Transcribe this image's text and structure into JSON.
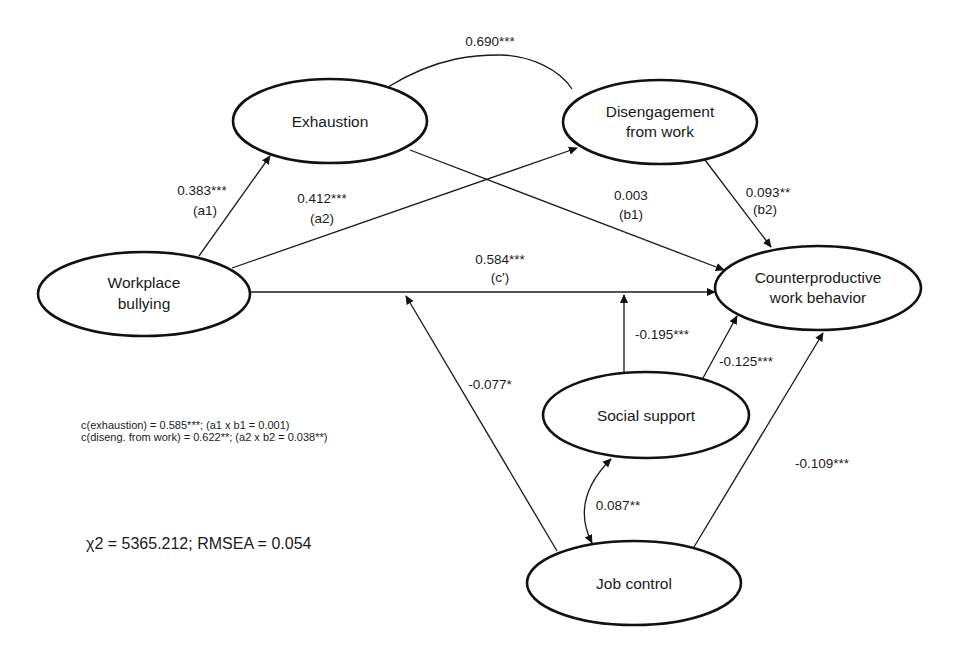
{
  "diagram": {
    "type": "structural-equation-path-model",
    "nodes": {
      "exhaustion": {
        "label_lines": [
          "Exhaustion"
        ]
      },
      "disengagement": {
        "label_lines": [
          "Disengagement",
          "from work"
        ]
      },
      "bullying": {
        "label_lines": [
          "Workplace",
          "bullying"
        ]
      },
      "cwb": {
        "label_lines": [
          "Counterproductive",
          "work behavior"
        ]
      },
      "social_support": {
        "label_lines": [
          "Social support"
        ]
      },
      "job_control": {
        "label_lines": [
          "Job control"
        ]
      }
    },
    "edges": {
      "exhaustion_disengagement": {
        "from": "Exhaustion",
        "to": "Disengagement from work",
        "type": "covariance",
        "coef": "0.690***"
      },
      "a1": {
        "from": "Workplace bullying",
        "to": "Exhaustion",
        "coef": "0.383***",
        "tag": "(a1)"
      },
      "a2": {
        "from": "Workplace bullying",
        "to": "Disengagement from work",
        "coef": "0.412***",
        "tag": "(a2)"
      },
      "b1": {
        "from": "Exhaustion",
        "to": "Counterproductive work behavior",
        "coef": "0.003",
        "tag": "(b1)"
      },
      "b2": {
        "from": "Disengagement from work",
        "to": "Counterproductive work behavior",
        "coef": "0.093**",
        "tag": "(b2)"
      },
      "c_prime": {
        "from": "Workplace bullying",
        "to": "Counterproductive work behavior",
        "coef": "0.584***",
        "tag": "(c')"
      },
      "ss_moderation": {
        "from": "Social support",
        "to": "c' path",
        "coef": "-0.195***"
      },
      "ss_cwb": {
        "from": "Social support",
        "to": "Counterproductive work behavior",
        "coef": "-0.125***"
      },
      "jc_moderation": {
        "from": "Job control",
        "to": "c' path",
        "coef": "-0.077*"
      },
      "jc_cwb": {
        "from": "Job control",
        "to": "Counterproductive work behavior",
        "coef": "-0.109***"
      },
      "ss_jc": {
        "from": "Social support",
        "to": "Job control",
        "type": "covariance",
        "coef": "0.087**"
      }
    },
    "notes": {
      "line1": "c(exhaustion) = 0.585***; (a1 x b1 = 0.001)",
      "line2": "c(diseng. from work) = 0.622**; (a2 x b2 = 0.038**)"
    },
    "fit": "χ2 = 5365.212; RMSEA = 0.054"
  }
}
